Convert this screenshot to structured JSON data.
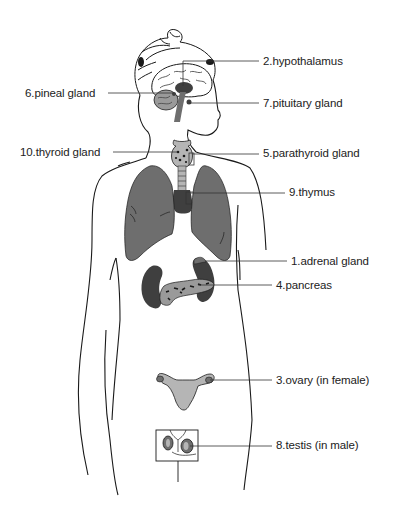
{
  "diagram": {
    "colors": {
      "outline": "#1a1a1a",
      "organ_fill": "#6e6e6e",
      "organ_dark": "#3f3f3f",
      "gland_fill": "#9a9a9a",
      "light_fill": "#b5b5b5",
      "leader_line": "#333333",
      "text": "#222222"
    },
    "labels": [
      {
        "id": "hypothalamus",
        "number": 2,
        "text": "2.hypothalamus"
      },
      {
        "id": "pineal",
        "number": 6,
        "text": "6.pineal gland"
      },
      {
        "id": "pituitary",
        "number": 7,
        "text": "7.pituitary gland"
      },
      {
        "id": "thyroid",
        "number": 10,
        "text": "10.thyroid gland"
      },
      {
        "id": "parathyroid",
        "number": 5,
        "text": "5.parathyroid gland"
      },
      {
        "id": "thymus",
        "number": 9,
        "text": "9.thymus"
      },
      {
        "id": "adrenal",
        "number": 1,
        "text": "1.adrenal gland"
      },
      {
        "id": "pancreas",
        "number": 4,
        "text": "4.pancreas"
      },
      {
        "id": "ovary",
        "number": 3,
        "text": "3.ovary (in female)"
      },
      {
        "id": "testis",
        "number": 8,
        "text": "8.testis (in male)"
      }
    ]
  }
}
